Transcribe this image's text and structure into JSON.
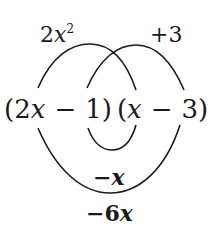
{
  "diagram": {
    "type": "FOIL multiplication diagram",
    "top_labels": {
      "first_product": {
        "coef": "2",
        "var": "x",
        "exp": "2"
      },
      "last_product": {
        "text": "+3"
      }
    },
    "factors": {
      "first": {
        "open": "(",
        "coef": "2",
        "var": "x",
        "op": "−",
        "const": "1",
        "close": ")"
      },
      "second": {
        "open": "(",
        "var": "x",
        "op": "−",
        "const": "3",
        "close": ")"
      }
    },
    "bottom_labels": {
      "inner_product": {
        "sign": "−",
        "var": "x"
      },
      "outer_product": {
        "sign": "−",
        "coef": "6",
        "var": "x"
      }
    },
    "arcs": [
      {
        "name": "first-terms-arc",
        "connects": [
          "2x",
          "x"
        ],
        "position": "top"
      },
      {
        "name": "last-terms-arc",
        "connects": [
          "−1",
          "−3"
        ],
        "position": "top"
      },
      {
        "name": "inner-terms-arc",
        "connects": [
          "−1",
          "x"
        ],
        "position": "bottom"
      },
      {
        "name": "outer-terms-arc",
        "connects": [
          "2x",
          "−3"
        ],
        "position": "bottom"
      }
    ],
    "stroke_color": "#1a1a1a"
  }
}
